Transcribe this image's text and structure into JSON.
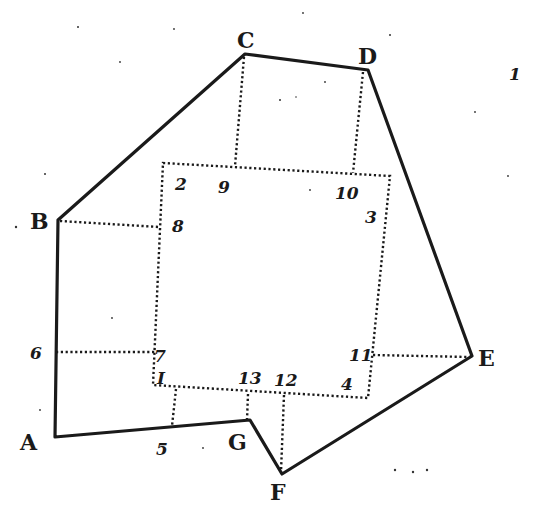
{
  "figure": {
    "vertices": {
      "A": "A",
      "B": "B",
      "C": "C",
      "D": "D",
      "E": "E",
      "F": "F",
      "G": "G"
    },
    "station_points": {
      "p1": "I",
      "p2": "2",
      "p3": "3",
      "p4": "4",
      "p5": "5",
      "p6": "6",
      "p7": "7",
      "p8": "8",
      "p9": "9",
      "p10": "10",
      "p11": "11",
      "p12": "12",
      "p13": "13"
    },
    "stray_mark": "1",
    "outer_polygon_order": [
      "A",
      "B",
      "C",
      "D",
      "E",
      "F",
      "G",
      "A"
    ],
    "inner_rectangle_order": [
      "1",
      "2",
      "3",
      "4"
    ],
    "offset_lines": [
      [
        "B",
        "8"
      ],
      [
        "6",
        "7"
      ],
      [
        "C",
        "9"
      ],
      [
        "D",
        "10"
      ],
      [
        "E",
        "11"
      ],
      [
        "5",
        "1-4 side"
      ],
      [
        "G",
        "13"
      ],
      [
        "F",
        "12"
      ]
    ],
    "colors": {
      "ink": "#1a1a1a",
      "paper": "#ffffff"
    }
  }
}
